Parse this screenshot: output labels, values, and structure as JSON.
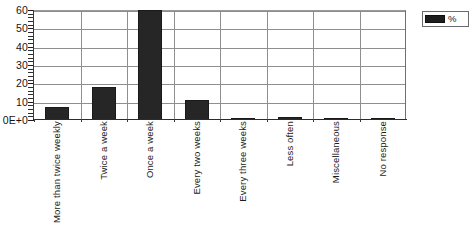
{
  "chart_data": {
    "type": "bar",
    "title": "",
    "xlabel": "",
    "ylabel": "",
    "categories": [
      "More than twice weekly",
      "Twice a week",
      "Once a week",
      "Every two weeks",
      "Every three weeks",
      "Less often",
      "Miscellaneous",
      "No response"
    ],
    "series": [
      {
        "name": "%",
        "values": [
          7,
          18,
          60,
          11,
          1,
          1.5,
          1,
          1
        ]
      }
    ],
    "values": [
      7,
      18,
      60,
      11,
      1,
      1.5,
      1,
      1
    ],
    "ylim": [
      0,
      60
    ],
    "ytick_labels": [
      "0E+0",
      "10",
      "20",
      "30",
      "40",
      "50",
      "60"
    ],
    "ytick_values": [
      0,
      10,
      20,
      30,
      40,
      50,
      60
    ],
    "y_minor_tick_step": 2,
    "grid": "horizontal-and-vertical",
    "bar_color": "#262626",
    "grid_color": "#8e8e8e",
    "axis_color": "#2b2b2b",
    "clipped_bars": [
      "Once a week"
    ],
    "note_clipped": "Once a week bar reaches the top of the 60 axis and is clipped"
  },
  "legend": {
    "position": "right-top",
    "entries": [
      {
        "label": "%",
        "color": "#1e1e1e"
      }
    ]
  }
}
